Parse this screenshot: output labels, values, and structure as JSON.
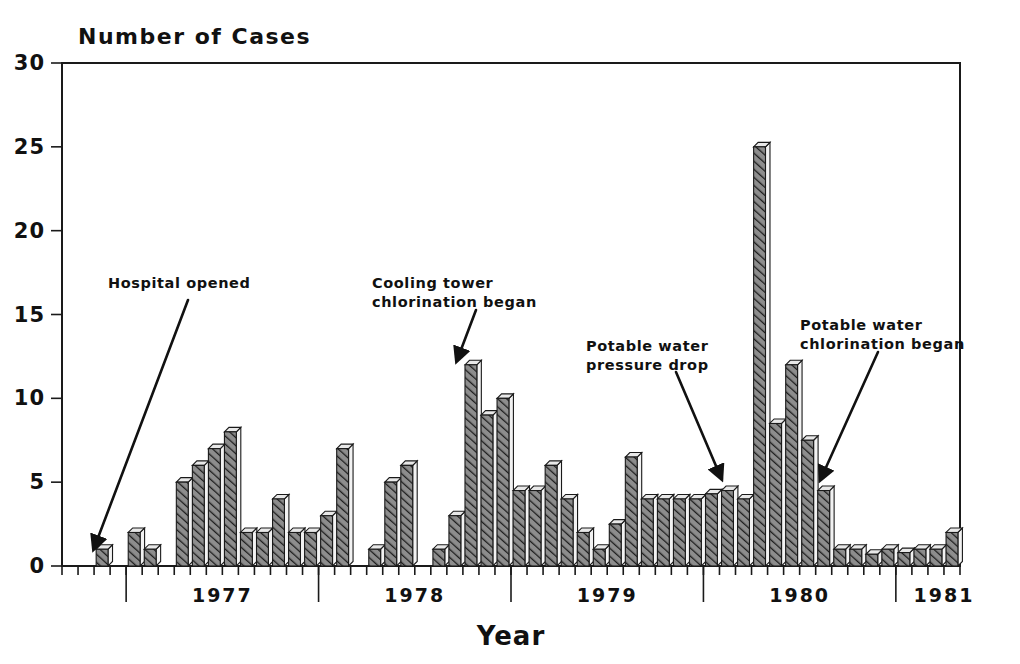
{
  "chart_data": {
    "type": "bar",
    "title": "",
    "ylabel": "Number of Cases",
    "xlabel": "Year",
    "ylim": [
      0,
      30
    ],
    "yticks": [
      0,
      5,
      10,
      15,
      20,
      25,
      30
    ],
    "grid": false,
    "legend": null,
    "x_tick_labels": [
      "1977",
      "1978",
      "1979",
      "1980",
      "1981"
    ],
    "x_unit": "month",
    "x_range_start": "1976-09",
    "x_range_end": "1980-12",
    "categories": [
      "1976-09",
      "1976-10",
      "1976-11",
      "1976-12",
      "1977-01",
      "1977-02",
      "1977-03",
      "1977-04",
      "1977-05",
      "1977-06",
      "1977-07",
      "1977-08",
      "1977-09",
      "1977-10",
      "1977-11",
      "1977-12",
      "1978-01",
      "1978-02",
      "1978-03",
      "1978-04",
      "1978-05",
      "1978-06",
      "1978-07",
      "1978-08",
      "1978-09",
      "1978-10",
      "1978-11",
      "1978-12",
      "1979-01",
      "1979-02",
      "1979-03",
      "1979-04",
      "1979-05",
      "1979-06",
      "1979-07",
      "1979-08",
      "1979-09",
      "1979-10",
      "1979-11",
      "1979-12",
      "1980-01",
      "1980-02",
      "1980-03",
      "1980-04",
      "1980-05",
      "1980-06",
      "1980-07",
      "1980-08",
      "1980-09",
      "1980-10",
      "1980-11",
      "1980-12"
    ],
    "values": [
      0,
      0,
      1,
      0,
      2,
      1,
      0,
      5,
      6,
      7,
      8,
      2,
      2,
      4,
      2,
      2,
      3,
      7,
      0,
      1,
      5,
      6,
      0,
      1,
      3,
      12,
      9,
      10,
      4.5,
      4.5,
      6,
      4,
      2,
      1,
      2.5,
      6.5,
      4,
      4,
      4,
      4,
      4.3,
      4.5,
      4,
      25,
      8.5,
      12,
      7.5,
      4.5,
      1,
      1,
      0.7,
      1
    ],
    "tail_values": [
      0.8,
      1,
      1,
      2
    ],
    "annotations": [
      {
        "id": "hospital-opened",
        "text_lines": [
          "Hospital opened"
        ],
        "text_x": 108,
        "text_y": 288,
        "leader_from": [
          188,
          300
        ],
        "leader_to": [
          96,
          543
        ],
        "arrow_angle": 111
      },
      {
        "id": "cooling-tower-chlorination",
        "text_lines": [
          "Cooling tower",
          "chlorination began"
        ],
        "text_x": 372,
        "text_y": 288,
        "leader_from": [
          476,
          310
        ],
        "leader_to": [
          459,
          355
        ],
        "arrow_angle": 70
      },
      {
        "id": "potable-water-pressure-drop",
        "text_lines": [
          "Potable water",
          "pressure drop"
        ],
        "text_x": 586,
        "text_y": 351,
        "leader_from": [
          676,
          372
        ],
        "leader_to": [
          719,
          473
        ],
        "arrow_angle": 67
      },
      {
        "id": "potable-water-chlorination",
        "text_lines": [
          "Potable water",
          "chlorination began"
        ],
        "text_x": 800,
        "text_y": 330,
        "leader_from": [
          878,
          352
        ],
        "leader_to": [
          823,
          474
        ],
        "arrow_angle": 114
      }
    ],
    "colors": {
      "ink": "#1a1a1a",
      "bar_fill": "#7a7a7a",
      "bar_hatch": "#2b2b2b",
      "bar_top": "#e8e8e8",
      "background": "#ffffff"
    }
  },
  "axes": {
    "y_title": "Number of Cases",
    "x_title": "Year",
    "y_tick_labels": [
      "0",
      "5",
      "10",
      "15",
      "20",
      "25",
      "30"
    ],
    "x_year_labels": [
      "1977",
      "1978",
      "1979",
      "1980",
      "1981"
    ]
  }
}
